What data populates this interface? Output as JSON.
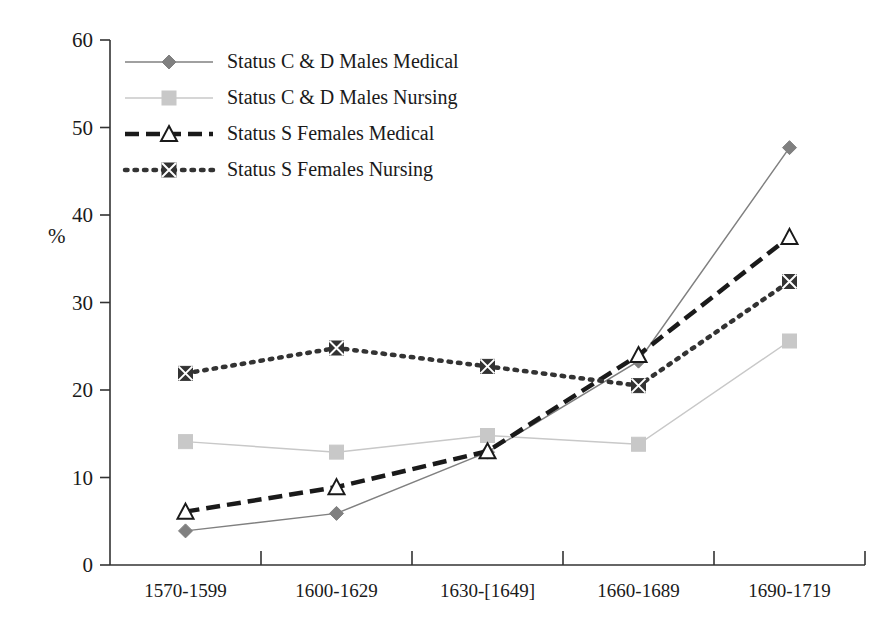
{
  "chart_data": {
    "type": "line",
    "title": "",
    "xlabel": "",
    "ylabel": "%",
    "ylim": [
      0,
      60
    ],
    "yticks": [
      0,
      10,
      20,
      30,
      40,
      50,
      60
    ],
    "grid": false,
    "legend_position": "top-left inside plot",
    "categories": [
      "1570-1599",
      "1600-1629",
      "1630-[1649]",
      "1660-1689",
      "1690-1719"
    ],
    "series": [
      {
        "name": "Status C & D Males Medical",
        "values": [
          3.9,
          5.9,
          12.9,
          23.3,
          47.7
        ],
        "color": "#808080",
        "marker": "diamond",
        "line_style": "solid"
      },
      {
        "name": "Status C & D Males Nursing",
        "values": [
          14.1,
          12.9,
          14.8,
          13.8,
          25.6
        ],
        "color": "#c8c8c8",
        "marker": "square",
        "line_style": "solid"
      },
      {
        "name": "Status S Females Medical",
        "values": [
          6.1,
          8.9,
          13.0,
          24.0,
          37.5
        ],
        "color": "#1a1a1a",
        "marker": "triangle-open",
        "line_style": "dashed"
      },
      {
        "name": "Status S Females Nursing",
        "values": [
          21.9,
          24.8,
          22.7,
          20.5,
          32.4
        ],
        "color": "#333333",
        "marker": "x-square",
        "line_style": "dotted"
      }
    ]
  },
  "axis": {
    "y_label": "%",
    "y_tick_labels": [
      "60",
      "50",
      "40",
      "30",
      "20",
      "10",
      "0"
    ],
    "x_tick_labels": [
      "1570-1599",
      "1600-1629",
      "1630-[1649]",
      "1660-1689",
      "1690-1719"
    ]
  },
  "legend": {
    "entries": [
      "Status C & D Males Medical",
      "Status C & D Males Nursing",
      "Status S Females Medical",
      "Status S Females Nursing"
    ]
  }
}
